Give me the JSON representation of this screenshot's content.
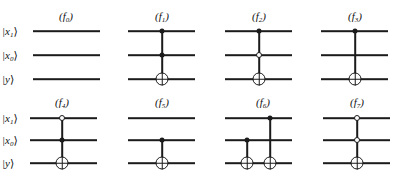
{
  "figure": {
    "kind": "quantum-circuit-diagram",
    "background_color": "#ffffff",
    "ink_color": "#1b1b1b",
    "columns": 4,
    "rows": 2,
    "wire_labels": [
      {
        "id": "x1",
        "text": "|x₁⟩",
        "base": "|x",
        "sub": "1",
        "ket": "⟩"
      },
      {
        "id": "x0",
        "text": "|x₀⟩",
        "base": "|x",
        "sub": "0",
        "ket": "⟩"
      },
      {
        "id": "y",
        "text": "|y⟩",
        "base": "|y",
        "sub": "",
        "ket": "⟩"
      }
    ]
  },
  "panels": [
    {
      "id": "f0",
      "title": "(f₀)",
      "title_base": "(f",
      "title_sub": "0",
      "title_tail": ")",
      "show_wire_labels": true,
      "gate_count": 0,
      "gates": [],
      "markers": {
        "x1": "none",
        "x0": "none",
        "y": "none"
      }
    },
    {
      "id": "f1",
      "title": "(f₁)",
      "title_base": "(f",
      "title_sub": "1",
      "title_tail": ")",
      "show_wire_labels": false,
      "gate_count": 1,
      "gates": [
        {
          "name": "toffoli",
          "controls": [
            {
              "wire": "x1",
              "type": "filled"
            },
            {
              "wire": "x0",
              "type": "filled"
            }
          ],
          "target": "y"
        }
      ],
      "markers": {
        "x1": "filled-control",
        "x0": "filled-control",
        "y": "xor-target"
      }
    },
    {
      "id": "f2",
      "title": "(f₂)",
      "title_base": "(f",
      "title_sub": "2",
      "title_tail": ")",
      "show_wire_labels": false,
      "gate_count": 1,
      "gates": [
        {
          "name": "toffoli",
          "controls": [
            {
              "wire": "x1",
              "type": "filled"
            },
            {
              "wire": "x0",
              "type": "open"
            }
          ],
          "target": "y"
        }
      ],
      "markers": {
        "x1": "filled-control",
        "x0": "open-control",
        "y": "xor-target"
      }
    },
    {
      "id": "f3",
      "title": "(f₃)",
      "title_base": "(f",
      "title_sub": "3",
      "title_tail": ")",
      "show_wire_labels": false,
      "gate_count": 1,
      "gates": [
        {
          "name": "cnot",
          "controls": [
            {
              "wire": "x1",
              "type": "filled"
            }
          ],
          "target": "y"
        }
      ],
      "markers": {
        "x1": "filled-control",
        "x0": "none",
        "y": "xor-target"
      }
    },
    {
      "id": "f4",
      "title": "(f₄)",
      "title_base": "(f",
      "title_sub": "4",
      "title_tail": ")",
      "show_wire_labels": true,
      "gate_count": 1,
      "gates": [
        {
          "name": "toffoli",
          "controls": [
            {
              "wire": "x1",
              "type": "open"
            },
            {
              "wire": "x0",
              "type": "filled"
            }
          ],
          "target": "y"
        }
      ],
      "markers": {
        "x1": "open-control",
        "x0": "filled-control",
        "y": "xor-target"
      }
    },
    {
      "id": "f5",
      "title": "(f₅)",
      "title_base": "(f",
      "title_sub": "5",
      "title_tail": ")",
      "show_wire_labels": false,
      "gate_count": 1,
      "gates": [
        {
          "name": "cnot",
          "controls": [
            {
              "wire": "x0",
              "type": "filled"
            }
          ],
          "target": "y"
        }
      ],
      "markers": {
        "x1": "none",
        "x0": "filled-control",
        "y": "xor-target"
      }
    },
    {
      "id": "f6",
      "title": "(f₆)",
      "title_base": "(f",
      "title_sub": "6",
      "title_tail": ")",
      "show_wire_labels": false,
      "gate_count": 2,
      "gates": [
        {
          "name": "cnot",
          "controls": [
            {
              "wire": "x0",
              "type": "filled"
            }
          ],
          "target": "y"
        },
        {
          "name": "cnot",
          "controls": [
            {
              "wire": "x1",
              "type": "filled"
            }
          ],
          "target": "y"
        }
      ],
      "markers": {
        "x1": "filled-control",
        "x0": "filled-control",
        "y": "xor-target-x2"
      }
    },
    {
      "id": "f7",
      "title": "(f₇)",
      "title_base": "(f",
      "title_sub": "7",
      "title_tail": ")",
      "show_wire_labels": false,
      "gate_count": 1,
      "gates": [
        {
          "name": "toffoli",
          "controls": [
            {
              "wire": "x1",
              "type": "open"
            },
            {
              "wire": "x0",
              "type": "open"
            }
          ],
          "target": "y"
        }
      ],
      "markers": {
        "x1": "open-control",
        "x0": "open-control",
        "y": "xor-target"
      }
    }
  ]
}
